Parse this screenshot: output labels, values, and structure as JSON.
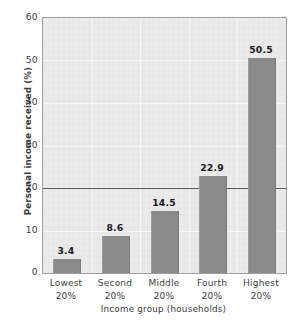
{
  "chart_data": {
    "type": "bar",
    "title": "",
    "categories": [
      "Lowest 20%",
      "Second 20%",
      "Middle 20%",
      "Fourth 20%",
      "Highest 20%"
    ],
    "category_lines": [
      [
        "Lowest",
        "20%"
      ],
      [
        "Second",
        "20%"
      ],
      [
        "Middle",
        "20%"
      ],
      [
        "Fourth",
        "20%"
      ],
      [
        "Highest",
        "20%"
      ]
    ],
    "values": [
      3.4,
      8.6,
      14.5,
      22.9,
      50.5
    ],
    "value_labels": [
      "3.4",
      "8.6",
      "14.5",
      "22.9",
      "50.5"
    ],
    "xlabel": "Income group (households)",
    "ylabel": "Personal income received (%)",
    "ylim": [
      0,
      60
    ],
    "yticks": [
      0,
      10,
      20,
      30,
      40,
      50,
      60
    ],
    "ytick_labels": [
      "0",
      "10",
      "20",
      "30",
      "40",
      "50",
      "60"
    ],
    "reference_line": 20,
    "grid": true,
    "legend": "none",
    "bar_color": "#8a8a8a",
    "plot_background": "#e9e9e9",
    "frame_color": "#9f9f9f",
    "reference_line_color": "#5a5a5a",
    "text_color": "#3d3d3d"
  }
}
